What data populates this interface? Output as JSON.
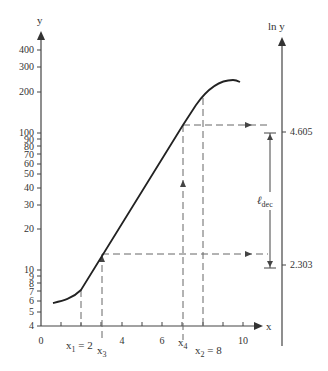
{
  "axes": {
    "y_label": "y",
    "x_label": "x",
    "lny_label": "ln y",
    "y_ticks": [
      "400",
      "300",
      "200",
      "100",
      "90",
      "80",
      "70",
      "60",
      "50",
      "40",
      "30",
      "20",
      "10",
      "9",
      "8",
      "7",
      "6",
      "5",
      "4"
    ],
    "x_ticks": [
      "0",
      "4",
      "6",
      "10"
    ],
    "lny_ticks": [
      "4.605",
      "2.303"
    ]
  },
  "annotations": {
    "x1": "x",
    "x1_sub": "1",
    "x1_eq": " = 2",
    "x2": "x",
    "x2_sub": "2",
    "x2_eq": " = 8",
    "x3": "x",
    "x3_sub": "3",
    "x4": "x",
    "x4_sub": "4",
    "ldec": "ℓ",
    "ldec_sub": "dec"
  },
  "colors": {
    "line": "#222222",
    "axis": "#444444",
    "dash": "#666666"
  }
}
